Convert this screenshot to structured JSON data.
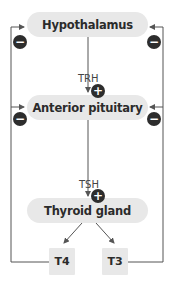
{
  "diagram": {
    "nodes": {
      "hypothalamus": "Hypothalamus",
      "anterior_pituitary": "Anterior pituitary",
      "thyroid_gland": "Thyroid gland",
      "t4": "T4",
      "t3": "T3"
    },
    "edges": {
      "trh": "TRH",
      "tsh": "TSH"
    },
    "signs": {
      "plus": "+",
      "minus": "−"
    },
    "colors": {
      "box_fill": "#e8e8e8",
      "line": "#555555",
      "sign_fill": "#2d2d2d"
    }
  }
}
